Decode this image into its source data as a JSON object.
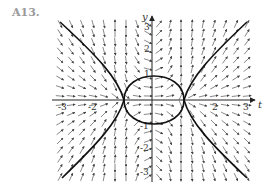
{
  "figure": {
    "label": "A13.",
    "axes": {
      "x_label": "t",
      "y_label": "y",
      "x_ticks": [
        "-3",
        "-2",
        "2",
        "3"
      ],
      "y_ticks": [
        "3",
        "2",
        "1",
        "-1",
        "-2",
        "-3"
      ]
    },
    "colors": {
      "ink": "#222222",
      "field": "#555555",
      "label": "#9a9a9a"
    }
  }
}
